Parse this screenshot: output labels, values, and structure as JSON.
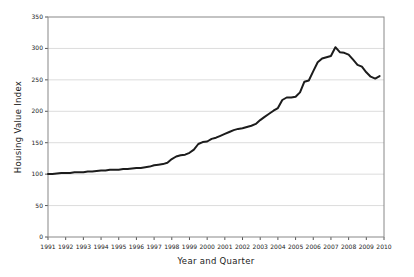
{
  "window": {
    "background": "#ffffff"
  },
  "chart_data": {
    "type": "line",
    "title": "",
    "xlabel": "Year and Quarter",
    "ylabel": "Housing Value Index",
    "x_tick_years": [
      1991,
      1992,
      1993,
      1994,
      1995,
      1996,
      1997,
      1998,
      1999,
      2000,
      2001,
      2002,
      2003,
      2004,
      2005,
      2006,
      2007,
      2008,
      2009,
      2010
    ],
    "xlim_years": [
      1991,
      2010
    ],
    "y_ticks": [
      0,
      50,
      100,
      150,
      200,
      250,
      300,
      350
    ],
    "ylim": [
      0,
      350
    ],
    "grid": true,
    "legend_position": "none",
    "line_color": "#1c1c1c",
    "grid_color": "#dcdcdc",
    "axis_color": "#888888",
    "tick_color": "#555555",
    "series": [
      {
        "name": "Housing Value Index",
        "start_quarter": "1991-Q1",
        "end_quarter": "2009-Q4",
        "interval": "quarterly",
        "values": [
          100,
          100,
          101,
          102,
          102,
          102,
          103,
          103,
          103,
          104,
          104,
          105,
          106,
          106,
          107,
          107,
          107,
          108,
          108,
          109,
          110,
          110,
          111,
          112,
          114,
          115,
          116,
          118,
          124,
          128,
          130,
          131,
          134,
          139,
          148,
          151,
          152,
          156,
          158,
          161,
          164,
          167,
          170,
          172,
          173,
          175,
          177,
          180,
          186,
          191,
          196,
          201,
          205,
          218,
          222,
          222,
          223,
          230,
          247,
          249,
          264,
          278,
          284,
          286,
          288,
          302,
          294,
          293,
          290,
          282,
          274,
          271,
          262,
          255,
          252,
          256
        ]
      }
    ],
    "layout": {
      "plot_left": 48,
      "plot_right": 384,
      "plot_top": 17,
      "plot_bottom": 237
    }
  }
}
